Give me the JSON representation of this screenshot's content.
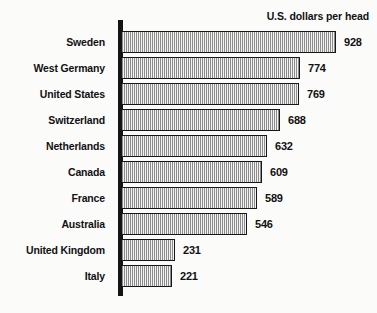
{
  "header": {
    "units_note": "U.S. dollars per head"
  },
  "chart_data": {
    "type": "bar",
    "orientation": "horizontal",
    "title": "",
    "subtitle": "",
    "xlabel": "U.S. dollars per head",
    "ylabel": "",
    "categories": [
      "Sweden",
      "West Germany",
      "United States",
      "Switzerland",
      "Netherlands",
      "Canada",
      "France",
      "Australia",
      "United Kingdom",
      "Italy"
    ],
    "values": [
      928,
      774,
      769,
      688,
      632,
      609,
      589,
      546,
      231,
      221
    ],
    "value_labels": [
      "928",
      "774",
      "769",
      "688",
      "632",
      "609",
      "589",
      "546",
      "231",
      "221"
    ],
    "xlim": [
      0,
      928
    ],
    "grid": false,
    "legend": false,
    "legend_position": "none",
    "bar_fill": "#b0b0b0",
    "bar_fill_pattern": "checkerboard-dither",
    "bar_border_color": "#171717",
    "axis_color": "#141414",
    "text_color": "#111111",
    "background_color": "#fbfbfa"
  }
}
